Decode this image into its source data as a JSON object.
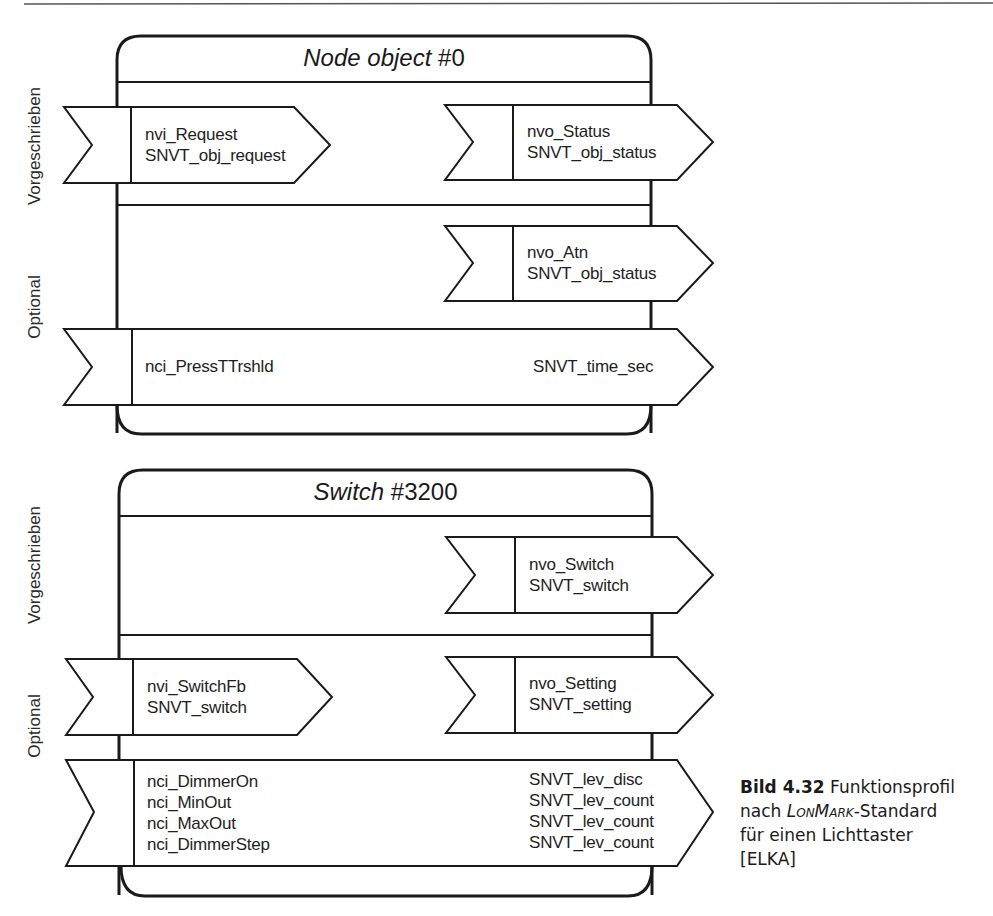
{
  "figure": {
    "top_rule": true,
    "blocks": [
      {
        "id": "node-object",
        "title_italic": "Node object",
        "title_rest": " #0",
        "side_labels": {
          "mandatory": "Vorgeschrieben",
          "optional": "Optional"
        },
        "mandatory": {
          "inputs": [
            {
              "name": "nvi_Request",
              "type": "SNVT_obj_request"
            }
          ],
          "outputs": [
            {
              "name": "nvo_Status",
              "type": "SNVT_obj_status"
            }
          ]
        },
        "optional": {
          "outputs": [
            {
              "name": "nvo_Atn",
              "type": "SNVT_obj_status"
            }
          ],
          "config": [
            {
              "name": "nci_PressTTrshld",
              "type": "SNVT_time_sec"
            }
          ]
        }
      },
      {
        "id": "switch",
        "title_italic": "Switch",
        "title_rest": " #3200",
        "side_labels": {
          "mandatory": "Vorgeschrieben",
          "optional": "Optional"
        },
        "mandatory": {
          "outputs": [
            {
              "name": "nvo_Switch",
              "type": "SNVT_switch"
            }
          ]
        },
        "optional": {
          "inputs": [
            {
              "name": "nvi_SwitchFb",
              "type": "SNVT_switch"
            }
          ],
          "outputs": [
            {
              "name": "nvo_Setting",
              "type": "SNVT_setting"
            }
          ],
          "config": [
            {
              "name": "nci_DimmerOn",
              "type": "SNVT_lev_disc"
            },
            {
              "name": "nci_MinOut",
              "type": "SNVT_lev_count"
            },
            {
              "name": "nci_MaxOut",
              "type": "SNVT_lev_count"
            },
            {
              "name": "nci_DimmerStep",
              "type": "SNVT_lev_count"
            }
          ]
        }
      }
    ],
    "caption": {
      "number": "Bild 4.32",
      "text_1": " Funktionsprofil",
      "text_2": "nach ",
      "brand": "LonMark",
      "text_3": "-Standard",
      "text_4": "für einen Lichttaster",
      "text_5": "[ELKA]"
    }
  },
  "colors": {
    "stroke": "#1a1a1a",
    "background": "#ffffff",
    "text": "#1e1e1e"
  }
}
